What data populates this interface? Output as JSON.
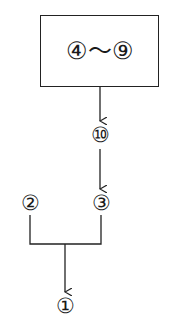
{
  "diagram": {
    "top_box": {
      "label": "④～⑨",
      "range_start": "④",
      "range_end": "⑨"
    },
    "nodes": {
      "n10": {
        "label": "⑩",
        "x": 100,
        "y": 135
      },
      "n3": {
        "label": "③",
        "x": 101,
        "y": 203
      },
      "n2": {
        "label": "②",
        "x": 30,
        "y": 203
      },
      "n1": {
        "label": "①",
        "x": 65,
        "y": 306
      }
    },
    "edges": [
      {
        "from": "④～⑨",
        "to": "⑩",
        "type": "arrow"
      },
      {
        "from": "⑩",
        "to": "③",
        "type": "arrow"
      },
      {
        "from": [
          "②",
          "③"
        ],
        "to": "①",
        "type": "merge-arrow"
      }
    ],
    "colors": {
      "line": "#222222",
      "background": "#ffffff"
    }
  }
}
